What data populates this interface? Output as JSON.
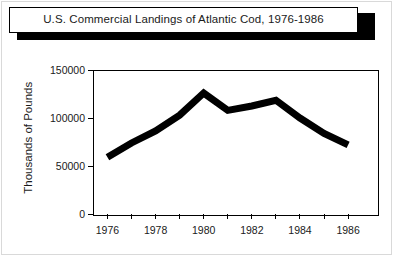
{
  "title": "U.S. Commercial Landings of Atlantic Cod, 1976-1986",
  "axis": {
    "ylabel": "Thousands of Pounds",
    "ytick_labels": [
      "0",
      "50000",
      "100000",
      "150000"
    ],
    "xtick_labels": [
      "1976",
      "1978",
      "1980",
      "1982",
      "1984",
      "1986"
    ]
  },
  "colors": {
    "line": "#000000",
    "axis": "#000000",
    "background": "#ffffff",
    "title_shadow": "#000000",
    "outer_frame": "#d9d9d9"
  },
  "chart_data": {
    "type": "line",
    "title": "U.S. Commercial Landings of Atlantic Cod, 1976-1986",
    "xlabel": "",
    "ylabel": "Thousands of Pounds",
    "x": [
      1976,
      1977,
      1978,
      1979,
      1980,
      1981,
      1982,
      1983,
      1984,
      1985,
      1986
    ],
    "values": [
      59000,
      74000,
      86500,
      103000,
      126000,
      108000,
      112500,
      118500,
      100000,
      84000,
      72000
    ],
    "series": [
      {
        "name": "Atlantic Cod landings",
        "values": [
          59000,
          74000,
          86500,
          103000,
          126000,
          108000,
          112500,
          118500,
          100000,
          84000,
          72000
        ]
      }
    ],
    "xlim": [
      1975.4,
      1987.2
    ],
    "ylim": [
      0,
      150000
    ],
    "yticks": [
      0,
      50000,
      100000,
      150000
    ],
    "xticks_labeled": [
      1976,
      1978,
      1980,
      1982,
      1984,
      1986
    ],
    "xticks_minor": [
      1977,
      1979,
      1981,
      1983,
      1985
    ],
    "grid": false,
    "legend": false,
    "line_width_px": 7,
    "line_color": "#000000"
  }
}
